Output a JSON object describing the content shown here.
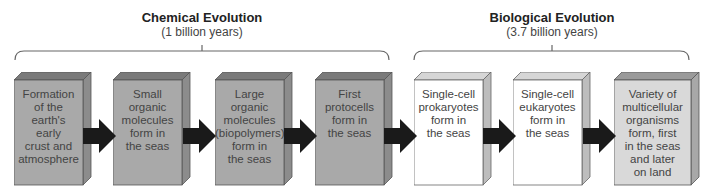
{
  "phases": [
    {
      "title": "Chemical Evolution",
      "duration": "(1 billion years)"
    },
    {
      "title": "Biological Evolution",
      "duration": "(3.7 billion years)"
    }
  ],
  "stages": [
    {
      "label": "Formation of the earth's early crust and atmosphere",
      "lines": [
        "Formation",
        "of the",
        "earth's",
        "early",
        "crust and",
        "atmosphere"
      ],
      "phase": "chemical",
      "fill": "#a9a9a9"
    },
    {
      "label": "Small organic molecules form in the seas",
      "lines": [
        "Small",
        "organic",
        "molecules",
        "form in",
        "the seas"
      ],
      "phase": "chemical",
      "fill": "#a9a9a9"
    },
    {
      "label": "Large organic molecules (biopolymers) form in the seas",
      "lines": [
        "Large",
        "organic",
        "molecules",
        "(biopolymers)",
        "form in",
        "the seas"
      ],
      "phase": "chemical",
      "fill": "#a9a9a9"
    },
    {
      "label": "First protocells form in the seas",
      "lines": [
        "First",
        "protocells",
        "form in",
        "the seas"
      ],
      "phase": "chemical",
      "fill": "#a9a9a9"
    },
    {
      "label": "Single-cell prokaryotes form in the seas",
      "lines": [
        "Single-cell",
        "prokaryotes",
        "form in",
        "the seas"
      ],
      "phase": "biological",
      "fill": "#ffffff"
    },
    {
      "label": "Single-cell eukaryotes form in the seas",
      "lines": [
        "Single-cell",
        "eukaryotes",
        "form in",
        "the seas"
      ],
      "phase": "biological",
      "fill": "#ffffff"
    },
    {
      "label": "Variety of multicellular organisms form, first in the seas and later on land",
      "lines": [
        "Variety of",
        "multicellular",
        "organisms",
        "form, first",
        "in the seas",
        "and later",
        "on land"
      ],
      "phase": "biological",
      "fill": "#d9d9d9"
    }
  ],
  "colors": {
    "chemical_fill": "#a9a9a9",
    "biological_fill": "#ffffff",
    "multicellular_fill": "#d9d9d9",
    "arrow": "#1a1a1a",
    "bracket": "#666666"
  }
}
